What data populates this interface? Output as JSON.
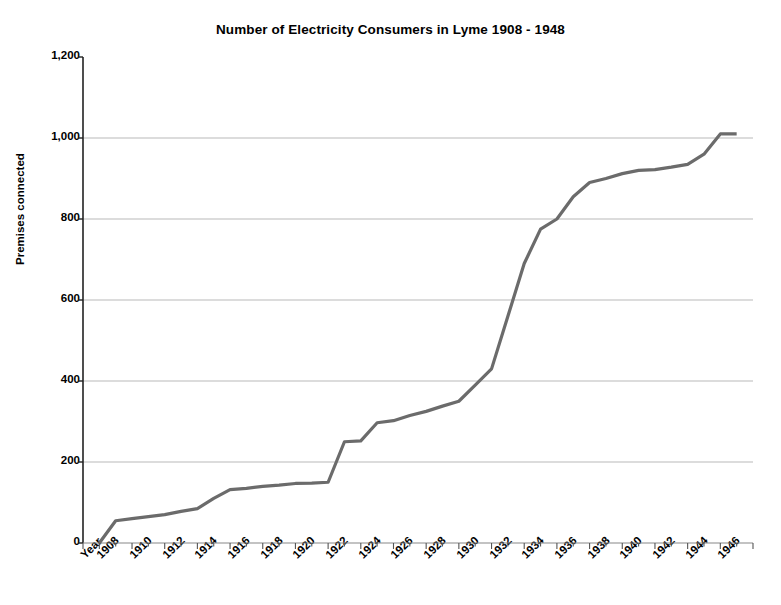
{
  "chart_data": {
    "type": "line",
    "title": "Number of Electricity Consumers in Lyme 1908 - 1948",
    "xlabel": "Year",
    "ylabel": "Premises connected",
    "ylim": [
      0,
      1200
    ],
    "xlim": [
      1907,
      1948
    ],
    "grid": true,
    "legend": false,
    "line_color": "#6b6b6b",
    "y_ticks": [
      "0",
      "200",
      "400",
      "600",
      "800",
      "1,000",
      "1,200"
    ],
    "y_tick_values": [
      0,
      200,
      400,
      600,
      800,
      1000,
      1200
    ],
    "x_tick_labels": [
      "Year",
      "1908",
      "1910",
      "1912",
      "1914",
      "1916",
      "1918",
      "1920",
      "1922",
      "1924",
      "1926",
      "1928",
      "1930",
      "1932",
      "1934",
      "1936",
      "1938",
      "1940",
      "1942",
      "1944",
      "1946"
    ],
    "x": [
      1908,
      1909,
      1910,
      1911,
      1912,
      1913,
      1914,
      1915,
      1916,
      1917,
      1918,
      1919,
      1920,
      1921,
      1922,
      1923,
      1924,
      1925,
      1926,
      1927,
      1928,
      1929,
      1930,
      1931,
      1932,
      1933,
      1934,
      1935,
      1936,
      1937,
      1938,
      1939,
      1940,
      1941,
      1942,
      1943,
      1944,
      1945,
      1946,
      1947
    ],
    "values": [
      0,
      55,
      60,
      65,
      70,
      78,
      85,
      110,
      132,
      135,
      140,
      143,
      147,
      148,
      150,
      250,
      252,
      297,
      302,
      315,
      325,
      338,
      350,
      390,
      430,
      560,
      690,
      775,
      800,
      855,
      890,
      900,
      912,
      920,
      922,
      928,
      935,
      960,
      1010,
      1010
    ]
  }
}
